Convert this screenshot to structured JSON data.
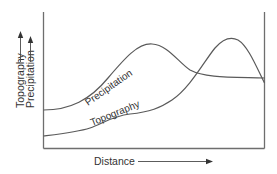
{
  "diagram": {
    "type": "orographic-profile",
    "colors": {
      "line": "#5a5a5a",
      "axis": "#6e6e6e",
      "text": "#333333",
      "background": "#ffffff"
    },
    "axes": {
      "x_label": "Distance",
      "y_label_1": "Topography",
      "y_label_2": "Precipitation"
    },
    "curves": [
      {
        "name": "Precipitation",
        "label": "Precipitation",
        "shape": "rises to a broad peak mid-chart, then declines and levels off"
      },
      {
        "name": "Topography",
        "label": "Topography",
        "shape": "gentle rise, then climbs to a peak near the right edge, then drops"
      }
    ],
    "icons": {
      "x_arrow": "arrow-right-icon",
      "y_arrow_1": "arrow-up-icon",
      "y_arrow_2": "arrow-up-icon"
    }
  }
}
